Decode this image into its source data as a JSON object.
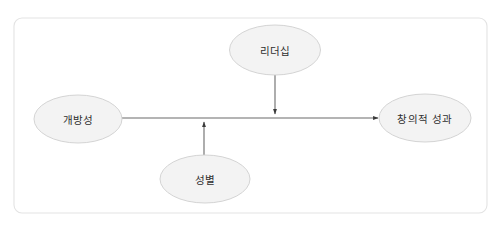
{
  "diagram": {
    "frame": {
      "name": "outer-frame",
      "x": 14,
      "y": 18,
      "width": 473,
      "height": 195,
      "radius": 8,
      "border_color": "#e3e3e3",
      "fill_color": "#ffffff"
    },
    "style": {
      "node_fill": "#f3f3f3",
      "node_stroke": "#cfcfcf",
      "edge_color": "#6b6b6b",
      "text_color": "#2f2f2f"
    },
    "nodes": [
      {
        "id": "leadership",
        "label": "리더십",
        "role": "moderator-top",
        "cx": 275,
        "cy": 50,
        "rx": 45.5,
        "ry": 25
      },
      {
        "id": "openness",
        "label": "개방성",
        "role": "independent-variable",
        "cx": 78,
        "cy": 119,
        "rx": 44,
        "ry": 24
      },
      {
        "id": "creative-performance",
        "label": "창의적 성과",
        "role": "dependent-variable",
        "cx": 425,
        "cy": 118,
        "rx": 46,
        "ry": 24
      },
      {
        "id": "gender",
        "label": "성별",
        "role": "moderator-bottom",
        "cx": 205,
        "cy": 179,
        "rx": 45,
        "ry": 24
      }
    ],
    "edges": [
      {
        "id": "openness-to-performance",
        "from": "openness",
        "to": "creative-performance",
        "kind": "main-path",
        "x1": 122,
        "y1": 118,
        "x2": 378,
        "y2": 118,
        "arrowhead": "end"
      },
      {
        "id": "leadership-moderation",
        "from": "leadership",
        "to": "openness-to-performance",
        "kind": "moderation-path",
        "x1": 275,
        "y1": 75,
        "x2": 275,
        "y2": 114,
        "arrowhead": "end"
      },
      {
        "id": "gender-moderation",
        "from": "gender",
        "to": "openness-to-performance",
        "kind": "moderation-path",
        "x1": 204,
        "y1": 155,
        "x2": 204,
        "y2": 122,
        "arrowhead": "end"
      }
    ]
  }
}
